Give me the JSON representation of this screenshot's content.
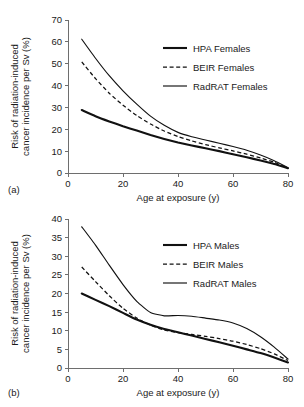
{
  "figure": {
    "panels": [
      {
        "key": "a",
        "label": "(a)"
      },
      {
        "key": "b",
        "label": "(b)"
      }
    ]
  },
  "chart_data": [
    {
      "type": "line",
      "panel": "(a)",
      "title": "",
      "xlabel": "Age at exposure (y)",
      "ylabel": "Risk of radiation-induced cancer incidence per Sv (%)",
      "ylabel_line1": "Risk of radiation-induced",
      "ylabel_line2": "cancer incidence per Sv (%)",
      "xlim": [
        0,
        80
      ],
      "ylim": [
        0,
        70
      ],
      "xticks": [
        0,
        20,
        40,
        60,
        80
      ],
      "yticks": [
        0,
        10,
        20,
        30,
        40,
        50,
        60,
        70
      ],
      "grid": false,
      "legend_position": "upper-right",
      "x": [
        5,
        10,
        15,
        20,
        25,
        30,
        35,
        40,
        45,
        50,
        55,
        60,
        65,
        70,
        75,
        80
      ],
      "series": [
        {
          "name": "HPA Females",
          "style": "solid-thick",
          "color": "#111111",
          "values": [
            28.8,
            26.0,
            23.6,
            21.4,
            19.4,
            17.4,
            15.6,
            14.0,
            12.6,
            11.3,
            10.0,
            8.6,
            7.2,
            5.7,
            4.1,
            2.2
          ]
        },
        {
          "name": "BEIR Females",
          "style": "dashed",
          "color": "#111111",
          "values": [
            50.8,
            43.2,
            36.5,
            31.0,
            26.3,
            22.4,
            19.2,
            16.7,
            14.7,
            13.0,
            11.5,
            10.1,
            8.6,
            6.9,
            4.9,
            2.3
          ]
        },
        {
          "name": "RadRAT Females",
          "style": "solid-thin",
          "color": "#111111",
          "values": [
            61.2,
            52.5,
            44.5,
            37.6,
            31.5,
            26.0,
            21.8,
            18.6,
            16.6,
            15.1,
            13.6,
            12.1,
            10.4,
            8.2,
            5.6,
            2.4
          ]
        }
      ]
    },
    {
      "type": "line",
      "panel": "(b)",
      "title": "",
      "xlabel": "Age at exposure (y)",
      "ylabel": "Risk of radiation-induced cancer incidence per Sv (%)",
      "ylabel_line1": "Risk of radiation-induced",
      "ylabel_line2": "cancer incidence per Sv (%)",
      "xlim": [
        0,
        80
      ],
      "ylim": [
        0,
        40
      ],
      "xticks": [
        0,
        20,
        40,
        60,
        80
      ],
      "yticks": [
        0,
        5,
        10,
        15,
        20,
        25,
        30,
        35,
        40
      ],
      "grid": false,
      "legend_position": "upper-right",
      "x": [
        5,
        10,
        15,
        20,
        25,
        30,
        35,
        40,
        45,
        50,
        55,
        60,
        65,
        70,
        75,
        80
      ],
      "series": [
        {
          "name": "HPA Males",
          "style": "solid-thick",
          "color": "#111111",
          "values": [
            20.0,
            18.3,
            16.6,
            14.8,
            13.0,
            11.6,
            10.5,
            9.6,
            8.7,
            7.8,
            6.9,
            6.0,
            5.0,
            4.0,
            2.8,
            1.5
          ]
        },
        {
          "name": "BEIR Males",
          "style": "dashed",
          "color": "#111111",
          "values": [
            27.1,
            23.2,
            19.4,
            16.0,
            13.4,
            11.5,
            10.2,
            9.5,
            9.0,
            8.5,
            7.9,
            7.2,
            6.3,
            5.2,
            3.8,
            2.0
          ]
        },
        {
          "name": "RadRAT Males",
          "style": "solid-thin",
          "color": "#111111",
          "values": [
            37.9,
            33.0,
            27.6,
            22.4,
            17.9,
            14.9,
            14.0,
            14.1,
            13.9,
            13.4,
            12.9,
            12.1,
            10.6,
            8.4,
            5.6,
            2.4
          ]
        }
      ]
    }
  ]
}
